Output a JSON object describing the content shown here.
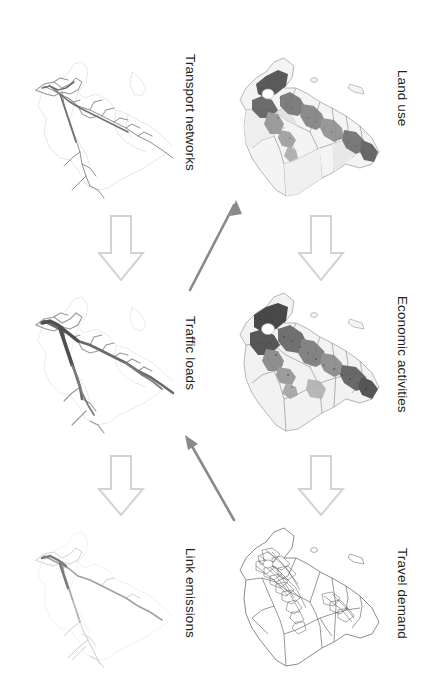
{
  "diagram": {
    "orientation": "labels rotated 90 degrees clockwise",
    "background_color": "#ffffff",
    "hollow_arrow_color": "#d0d0d0",
    "solid_arrow_color": "#8a8a8a",
    "label_color": "#231f20",
    "map_line_color": "#b8b8b8",
    "map_dark_color": "#3a3a3a"
  },
  "nodes": [
    {
      "id": "transport-networks",
      "label": "Transport networks",
      "column": "left",
      "row": 1,
      "map_type": "network",
      "map_name": "transport-networks-map"
    },
    {
      "id": "land-use",
      "label": "Land use",
      "column": "right",
      "row": 1,
      "map_type": "choropleth",
      "map_name": "land-use-map"
    },
    {
      "id": "traffic-loads",
      "label": "Traffic loads",
      "column": "left",
      "row": 2,
      "map_type": "network",
      "map_name": "traffic-loads-map"
    },
    {
      "id": "economic-activities",
      "label": "Economic activities",
      "column": "right",
      "row": 2,
      "map_type": "choropleth",
      "map_name": "economic-activities-map"
    },
    {
      "id": "link-emissions",
      "label": "Link emissions",
      "column": "left",
      "row": 3,
      "map_type": "network",
      "map_name": "link-emissions-map"
    },
    {
      "id": "travel-demand",
      "label": "Travel demand",
      "column": "right",
      "row": 3,
      "map_type": "zones",
      "map_name": "travel-demand-map"
    }
  ],
  "connections": [
    {
      "id": "transport-to-traffic",
      "from": "transport-networks",
      "to": "traffic-loads",
      "style": "hollow",
      "direction": "down",
      "name": "hollow-arrow-transport-to-traffic"
    },
    {
      "id": "traffic-to-emissions",
      "from": "traffic-loads",
      "to": "link-emissions",
      "style": "hollow",
      "direction": "down",
      "name": "hollow-arrow-traffic-to-emissions"
    },
    {
      "id": "landuse-to-economic",
      "from": "land-use",
      "to": "economic-activities",
      "style": "hollow",
      "direction": "down",
      "name": "hollow-arrow-landuse-to-economic"
    },
    {
      "id": "economic-to-travel",
      "from": "economic-activities",
      "to": "travel-demand",
      "style": "hollow",
      "direction": "down",
      "name": "hollow-arrow-economic-to-travel"
    },
    {
      "id": "traffic-to-landuse",
      "from": "traffic-loads",
      "to": "land-use",
      "style": "solid",
      "direction": "up-right",
      "name": "solid-arrow-traffic-to-landuse"
    },
    {
      "id": "travel-to-traffic",
      "from": "travel-demand",
      "to": "traffic-loads",
      "style": "solid",
      "direction": "up-left",
      "name": "solid-arrow-travel-to-traffic"
    }
  ]
}
